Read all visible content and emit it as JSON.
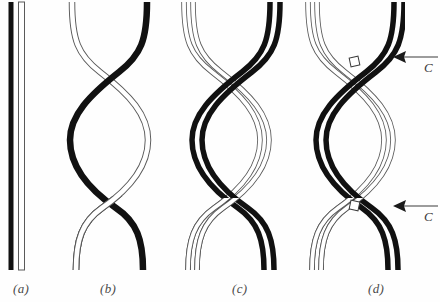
{
  "figure": {
    "width": 440,
    "height": 302,
    "background_color": "#fefefe",
    "strand_dark_color": "#111111",
    "strand_light_fill": "#ffffff",
    "strand_light_stroke": "#5a5a5a",
    "label_color": "#4a4a4a"
  },
  "panels": [
    {
      "id": "a",
      "label": "(a)",
      "label_x": 13,
      "label_y": 281,
      "description": "two parallel straight vertical strands, one dark one light",
      "strand_count": 2,
      "crossovers": 0,
      "doubled": false,
      "has_cut_marks": false
    },
    {
      "id": "b",
      "label": "(b)",
      "label_x": 100,
      "label_y": 281,
      "description": "single dark strand and single light strand crossing twice forming a lens shape",
      "strand_count": 2,
      "crossovers": 2,
      "doubled": false,
      "has_cut_marks": false
    },
    {
      "id": "c",
      "label": "(c)",
      "label_x": 232,
      "label_y": 281,
      "description": "doubled dark pair and doubled light pair crossing twice",
      "strand_count": 4,
      "crossovers": 2,
      "doubled": true,
      "has_cut_marks": false
    },
    {
      "id": "d",
      "label": "(d)",
      "label_x": 368,
      "label_y": 281,
      "description": "doubled dark pair and doubled light pair crossing twice with cut sites marked",
      "strand_count": 4,
      "crossovers": 2,
      "doubled": true,
      "has_cut_marks": true
    }
  ],
  "annotations": [
    {
      "name": "cut-arrow-upper",
      "label": "C",
      "label_x": 424,
      "label_y": 62,
      "arrow_tip_x": 393,
      "arrow_tail_x": 438,
      "arrow_y": 57,
      "direction": "left",
      "points_to": "upper crossover of panel d"
    },
    {
      "name": "cut-arrow-lower",
      "label": "C",
      "label_x": 424,
      "label_y": 211,
      "arrow_tip_x": 393,
      "arrow_tail_x": 438,
      "arrow_y": 206,
      "direction": "left",
      "points_to": "lower crossover of panel d"
    }
  ]
}
